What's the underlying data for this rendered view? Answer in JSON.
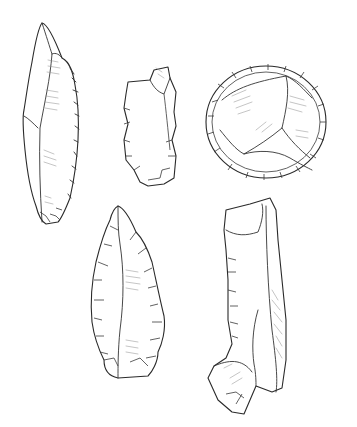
{
  "illustration": {
    "subject": "flint stone tools",
    "background": "#ffffff",
    "ink_color": "#2a2a2a",
    "hatch_color": "#8a8a8a",
    "tools": [
      {
        "id": "blade-point",
        "position": "top-left"
      },
      {
        "id": "flake-fragment",
        "position": "top-center"
      },
      {
        "id": "discoidal-scraper",
        "position": "top-right"
      },
      {
        "id": "retouched-point",
        "position": "bottom-left"
      },
      {
        "id": "elongated-blade-tool",
        "position": "bottom-right"
      }
    ]
  }
}
